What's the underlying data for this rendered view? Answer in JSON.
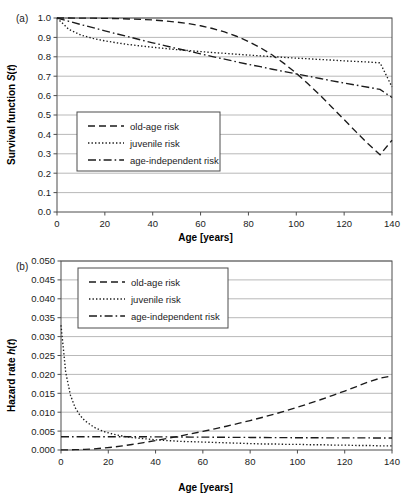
{
  "figure": {
    "panel_a_label": "(a)",
    "panel_b_label": "(b)"
  },
  "chart_data": [
    {
      "id": "panel-a",
      "type": "line",
      "title": "",
      "xlabel": "Age [years]",
      "ylabel": "Survival function S(t)",
      "ylabel_plain": "Survival function S(t)",
      "xlim": [
        0,
        140
      ],
      "ylim": [
        0,
        1.0
      ],
      "xticks": [
        0,
        20,
        40,
        60,
        80,
        100,
        120,
        140
      ],
      "yticks": [
        0.0,
        0.1,
        0.2,
        0.3,
        0.4,
        0.5,
        0.6,
        0.7,
        0.8,
        0.9,
        1.0
      ],
      "ytick_labels": [
        "0.0",
        "0.1",
        "0.2",
        "0.3",
        "0.4",
        "0.5",
        "0.6",
        "0.7",
        "0.8",
        "0.9",
        "1.0"
      ],
      "xtick_labels": [
        "0",
        "20",
        "40",
        "60",
        "80",
        "100",
        "120",
        "140"
      ],
      "grid": "horizontal",
      "legend_position": "center-left",
      "x": [
        0,
        5,
        10,
        15,
        20,
        25,
        30,
        35,
        40,
        45,
        50,
        55,
        60,
        65,
        70,
        75,
        80,
        85,
        90,
        95,
        100,
        105,
        110,
        115,
        120,
        125,
        130,
        135,
        140
      ],
      "series": [
        {
          "name": "old-age risk",
          "style": "dashed",
          "values": [
            1.0,
            1.0,
            0.999,
            0.999,
            0.998,
            0.997,
            0.995,
            0.993,
            0.99,
            0.985,
            0.979,
            0.971,
            0.96,
            0.946,
            0.928,
            0.906,
            0.879,
            0.847,
            0.809,
            0.765,
            0.715,
            0.66,
            0.601,
            0.539,
            0.476,
            0.413,
            0.352,
            0.295,
            0.37
          ]
        },
        {
          "name": "juvenile risk",
          "style": "dotted",
          "values": [
            1.0,
            0.941,
            0.912,
            0.895,
            0.882,
            0.872,
            0.863,
            0.856,
            0.849,
            0.843,
            0.837,
            0.832,
            0.827,
            0.822,
            0.818,
            0.813,
            0.809,
            0.805,
            0.801,
            0.797,
            0.793,
            0.79,
            0.786,
            0.783,
            0.779,
            0.776,
            0.773,
            0.769,
            0.645
          ]
        },
        {
          "name": "age-independent risk",
          "style": "dashdot",
          "values": [
            1.0,
            0.983,
            0.966,
            0.95,
            0.934,
            0.918,
            0.903,
            0.887,
            0.872,
            0.858,
            0.843,
            0.829,
            0.815,
            0.801,
            0.788,
            0.774,
            0.761,
            0.749,
            0.736,
            0.724,
            0.712,
            0.7,
            0.688,
            0.676,
            0.665,
            0.654,
            0.643,
            0.632,
            0.59
          ]
        }
      ]
    },
    {
      "id": "panel-b",
      "type": "line",
      "title": "",
      "xlabel": "Age [years]",
      "ylabel": "Hazard rate h(t)",
      "ylabel_plain": "Hazard rate h(t)",
      "xlim": [
        0,
        140
      ],
      "ylim": [
        0,
        0.05
      ],
      "xticks": [
        0,
        20,
        40,
        60,
        80,
        100,
        120,
        140
      ],
      "yticks": [
        0.0,
        0.005,
        0.01,
        0.015,
        0.02,
        0.025,
        0.03,
        0.035,
        0.04,
        0.045,
        0.05
      ],
      "ytick_labels": [
        "0.000",
        "0.005",
        "0.010",
        "0.015",
        "0.020",
        "0.025",
        "0.030",
        "0.035",
        "0.040",
        "0.045",
        "0.050"
      ],
      "xtick_labels": [
        "0",
        "20",
        "40",
        "60",
        "80",
        "100",
        "120",
        "140"
      ],
      "grid": "horizontal",
      "legend_position": "top-left",
      "x": [
        0,
        2,
        4,
        6,
        8,
        10,
        14,
        18,
        22,
        26,
        30,
        35,
        40,
        45,
        50,
        55,
        60,
        65,
        70,
        75,
        80,
        85,
        90,
        95,
        100,
        105,
        110,
        115,
        120,
        125,
        130,
        135,
        140
      ],
      "series": [
        {
          "name": "old-age risk",
          "style": "dashed",
          "values": [
            2e-05,
            3e-05,
            5e-05,
            8e-05,
            0.00012,
            0.00017,
            0.00031,
            0.00051,
            0.00077,
            0.00109,
            0.00146,
            0.00196,
            0.0025,
            0.00307,
            0.00366,
            0.00428,
            0.00492,
            0.00559,
            0.00629,
            0.00702,
            0.00779,
            0.0086,
            0.00946,
            0.01036,
            0.01131,
            0.01231,
            0.01336,
            0.01446,
            0.0156,
            0.01678,
            0.018,
            0.019,
            0.0196
          ]
        },
        {
          "name": "juvenile risk",
          "style": "dotted",
          "values": [
            0.033,
            0.0205,
            0.0145,
            0.0112,
            0.0092,
            0.0078,
            0.006,
            0.0049,
            0.0042,
            0.0037,
            0.0033,
            0.003,
            0.0027,
            0.0025,
            0.0023,
            0.0022,
            0.0021,
            0.002,
            0.0019,
            0.0018,
            0.0017,
            0.0016,
            0.0016,
            0.0015,
            0.0015,
            0.0014,
            0.0014,
            0.0013,
            0.0013,
            0.0012,
            0.0012,
            0.0011,
            0.0011
          ]
        },
        {
          "name": "age-independent risk",
          "style": "dashdot",
          "values": [
            0.0035,
            0.0035,
            0.0035,
            0.0035,
            0.0035,
            0.0035,
            0.0035,
            0.0035,
            0.0035,
            0.0035,
            0.0035,
            0.0035,
            0.00348,
            0.00346,
            0.00344,
            0.00342,
            0.0034,
            0.00338,
            0.00336,
            0.00334,
            0.00332,
            0.0033,
            0.00328,
            0.00326,
            0.00325,
            0.00324,
            0.00323,
            0.00322,
            0.00321,
            0.0032,
            0.00319,
            0.00318,
            0.00317
          ]
        }
      ]
    }
  ],
  "legend": {
    "entries": [
      {
        "label": "old-age risk",
        "style": "dashed"
      },
      {
        "label": "juvenile risk",
        "style": "dotted"
      },
      {
        "label": "age-independent risk",
        "style": "dashdot"
      }
    ]
  },
  "colors": {
    "line": "#1b1b1b",
    "grid": "#9b9b9b",
    "frame": "#4d4d4d",
    "background": "#ffffff"
  }
}
